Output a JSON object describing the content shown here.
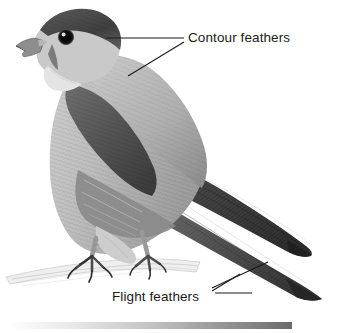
{
  "figure": {
    "background_color": "#ffffff",
    "width": 352,
    "height": 333
  },
  "labels": {
    "contour": {
      "text": "Contour feathers",
      "color": "#1a1a1a",
      "points_to": "head-and-upper-body"
    },
    "flight": {
      "text": "Flight feathers",
      "color": "#1a1a1a",
      "points_to": "wing-tip-and-tail"
    }
  },
  "leader_lines": {
    "color": "#1a1a1a",
    "contour_head": "horizontal line from label to crown of head",
    "contour_body": "diagonal line from label down-left to mantle",
    "flight_wing": "diagonal line from label up-right to wing tip",
    "flight_tail": "diagonal line from label right to tail"
  },
  "bird": {
    "parts": [
      "dark-crown",
      "pale-cheek",
      "hooked-beak",
      "dark-eye",
      "pale-throat",
      "light-breast",
      "dark-wing-coverts",
      "folded-wing",
      "long-tail",
      "scaled-legs",
      "talons",
      "perch-branch"
    ],
    "palette": {
      "darkest": "#2b2b2b",
      "dark": "#4a4a4a",
      "mid": "#757575",
      "light": "#b9b9b9",
      "lightest": "#dedede",
      "paper": "#ffffff"
    }
  },
  "bottom_bar": {
    "present": true,
    "gradient_from": "#fdfdfd",
    "gradient_to": "#6b6b6b"
  }
}
